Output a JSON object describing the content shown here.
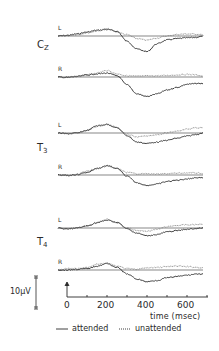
{
  "chart_data": {
    "type": "line",
    "title": "",
    "xlabel": "time (msec)",
    "ylabel": "",
    "xlim": [
      -45,
      680
    ],
    "x_ticks": [
      0,
      200,
      400,
      600
    ],
    "x_minor_ticks": [
      100,
      300,
      500,
      700
    ],
    "scale_bar": {
      "label": "10µV",
      "value_uV": 10
    },
    "grid": false,
    "legend": {
      "position": "bottom",
      "entries": [
        {
          "name": "attended",
          "style": "solid"
        },
        {
          "name": "unattended",
          "style": "dotted"
        }
      ]
    },
    "panels": [
      {
        "site": "Cz",
        "channel": "L",
        "series": [
          {
            "name": "attended",
            "x": [
              -45,
              0,
              50,
              100,
              150,
              200,
              250,
              300,
              350,
              400,
              450,
              500,
              550,
              600,
              650,
              680
            ],
            "y": [
              0,
              0.2,
              0.8,
              1.5,
              2.2,
              2.5,
              1.8,
              -2,
              -5,
              -6,
              -3,
              -1.5,
              -1,
              -0.7,
              -0.5,
              0
            ]
          },
          {
            "name": "unattended",
            "x": [
              -45,
              0,
              50,
              100,
              150,
              200,
              250,
              300,
              350,
              400,
              450,
              500,
              550,
              600,
              650,
              680
            ],
            "y": [
              0,
              0.3,
              0.5,
              1.2,
              1.9,
              2.8,
              1.5,
              0.5,
              -1,
              -1.6,
              -0.8,
              0,
              0.6,
              0.8,
              0.7,
              0.5
            ]
          }
        ]
      },
      {
        "site": "Cz",
        "channel": "R",
        "series": [
          {
            "name": "attended",
            "x": [
              -45,
              0,
              50,
              100,
              150,
              200,
              250,
              300,
              350,
              400,
              450,
              500,
              550,
              600,
              650,
              680
            ],
            "y": [
              0,
              -0.2,
              0.2,
              0.8,
              1.2,
              1.5,
              0.5,
              -3,
              -6.5,
              -7.5,
              -6.5,
              -5,
              -4,
              -2.8,
              -2.5,
              -2.5
            ]
          },
          {
            "name": "unattended",
            "x": [
              -45,
              0,
              50,
              100,
              150,
              200,
              250,
              300,
              350,
              400,
              450,
              500,
              550,
              600,
              650,
              680
            ],
            "y": [
              0,
              -0.1,
              0.2,
              0.8,
              1.6,
              2.5,
              1.2,
              0.5,
              0.3,
              0.4,
              0.5,
              0.6,
              0.8,
              1,
              0.8,
              0.3
            ]
          }
        ]
      },
      {
        "site": "T3",
        "channel": "L",
        "series": [
          {
            "name": "attended",
            "x": [
              -45,
              0,
              50,
              100,
              150,
              200,
              250,
              300,
              350,
              400,
              450,
              500,
              550,
              600,
              650,
              680
            ],
            "y": [
              0,
              -0.3,
              0,
              1,
              2.8,
              3.3,
              2,
              -1,
              -3.5,
              -4,
              -3.5,
              -2.8,
              -2,
              -1.2,
              -0.5,
              0
            ]
          },
          {
            "name": "unattended",
            "x": [
              -45,
              0,
              50,
              100,
              150,
              200,
              250,
              300,
              350,
              400,
              450,
              500,
              550,
              600,
              650,
              680
            ],
            "y": [
              0,
              -0.3,
              0,
              1,
              2.5,
              3.3,
              2.2,
              -0.5,
              -1.5,
              -1.2,
              -0.6,
              0,
              0.8,
              1.5,
              2,
              2
            ]
          }
        ]
      },
      {
        "site": "T3",
        "channel": "R",
        "series": [
          {
            "name": "attended",
            "x": [
              -45,
              0,
              50,
              100,
              150,
              200,
              250,
              300,
              350,
              400,
              450,
              500,
              550,
              600,
              650,
              680
            ],
            "y": [
              0,
              -0.2,
              0.2,
              1,
              2.5,
              3.6,
              2.5,
              -0.5,
              -3,
              -4,
              -3.5,
              -2.5,
              -2,
              -1.5,
              -1,
              -1
            ]
          },
          {
            "name": "unattended",
            "x": [
              -45,
              0,
              50,
              100,
              150,
              200,
              250,
              300,
              350,
              400,
              450,
              500,
              550,
              600,
              650,
              680
            ],
            "y": [
              0,
              -0.2,
              0.3,
              1.5,
              2.5,
              3.3,
              2.5,
              1,
              0.5,
              0.5,
              0.3,
              0.5,
              0.7,
              0.8,
              0.8,
              0.5
            ]
          }
        ]
      },
      {
        "site": "T4",
        "channel": "L",
        "series": [
          {
            "name": "attended",
            "x": [
              -45,
              0,
              50,
              100,
              150,
              200,
              250,
              300,
              350,
              400,
              450,
              500,
              550,
              600,
              650,
              680
            ],
            "y": [
              0,
              -0.4,
              0,
              0.8,
              2,
              3,
              2.2,
              -0.3,
              -2,
              -3,
              -2.5,
              -1.5,
              -1,
              -0.5,
              -0.2,
              0
            ]
          },
          {
            "name": "unattended",
            "x": [
              -45,
              0,
              50,
              100,
              150,
              200,
              250,
              300,
              350,
              400,
              450,
              500,
              550,
              600,
              650,
              680
            ],
            "y": [
              0,
              -0.5,
              0,
              0.8,
              2.2,
              3.4,
              2,
              0,
              -1,
              -1.2,
              -0.5,
              0.5,
              1,
              1.2,
              1.3,
              1.5
            ]
          }
        ]
      },
      {
        "site": "T4",
        "channel": "R",
        "series": [
          {
            "name": "attended",
            "x": [
              -45,
              0,
              50,
              100,
              150,
              200,
              250,
              300,
              350,
              400,
              450,
              500,
              550,
              600,
              650,
              680
            ],
            "y": [
              0,
              0,
              0.3,
              0.5,
              1.5,
              2.5,
              1,
              -1.5,
              -3.5,
              -4.5,
              -4,
              -3,
              -2.5,
              -2,
              -1.5,
              -1.5
            ]
          },
          {
            "name": "unattended",
            "x": [
              -45,
              0,
              50,
              100,
              150,
              200,
              250,
              300,
              350,
              400,
              450,
              500,
              550,
              600,
              650,
              680
            ],
            "y": [
              0,
              0.5,
              0.5,
              1,
              2.3,
              2.5,
              1.5,
              0.5,
              0.3,
              0.8,
              1,
              1.3,
              1.5,
              1.3,
              1,
              0.8
            ]
          }
        ]
      }
    ]
  },
  "labels": {
    "sites": [
      {
        "main": "C",
        "sub": "Z"
      },
      {
        "main": "T",
        "sub": "3"
      },
      {
        "main": "T",
        "sub": "4"
      }
    ],
    "channels": [
      "L",
      "R",
      "L",
      "R",
      "L",
      "R"
    ],
    "scale": "10µV",
    "ticks": [
      "0",
      "200",
      "400",
      "600"
    ],
    "xlabel": "time (msec)",
    "legend_attended": "attended",
    "legend_unattended": "unattended"
  }
}
